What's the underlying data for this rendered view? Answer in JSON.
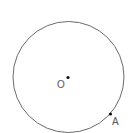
{
  "diagram": {
    "circle": {
      "cx": 68.5,
      "cy": 77,
      "r": 55.5,
      "stroke": "#6b6b6b"
    },
    "points": [
      {
        "name": "O",
        "label": "O",
        "x": 68,
        "y": 78
      },
      {
        "name": "A",
        "label": "A",
        "x": 110,
        "y": 114
      }
    ]
  }
}
